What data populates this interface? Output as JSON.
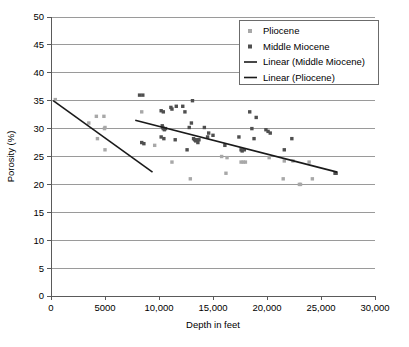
{
  "chart_data": {
    "type": "scatter",
    "title": "",
    "xlabel": "Depth in feet",
    "ylabel": "Porosity (%)",
    "xlim": [
      0,
      30000
    ],
    "ylim": [
      0,
      50
    ],
    "grid": "horizontal",
    "legend_position": "top-right",
    "x_ticks": [
      {
        "value": 0,
        "label": "0"
      },
      {
        "value": 5000,
        "label": "5000"
      },
      {
        "value": 10000,
        "label": "10,000"
      },
      {
        "value": 15000,
        "label": "15,000"
      },
      {
        "value": 20000,
        "label": "20,000"
      },
      {
        "value": 25000,
        "label": "25,000"
      },
      {
        "value": 30000,
        "label": "30,000"
      }
    ],
    "y_ticks": [
      {
        "value": 0,
        "label": "0"
      },
      {
        "value": 5,
        "label": "5"
      },
      {
        "value": 10,
        "label": "10"
      },
      {
        "value": 15,
        "label": "15"
      },
      {
        "value": 20,
        "label": "20"
      },
      {
        "value": 25,
        "label": "25"
      },
      {
        "value": 30,
        "label": "30"
      },
      {
        "value": 35,
        "label": "35"
      },
      {
        "value": 40,
        "label": "40"
      },
      {
        "value": 45,
        "label": "45"
      },
      {
        "value": 50,
        "label": "50"
      }
    ],
    "legend": [
      {
        "name": "Pliocene",
        "type": "marker",
        "color": "#a8a8a8"
      },
      {
        "name": "Middle Miocene",
        "type": "marker",
        "color": "#4f4f4f"
      },
      {
        "name": "Linear (Middle Miocene)",
        "type": "line",
        "color": "#1a1a1a"
      },
      {
        "name": "Linear (Pliocene)",
        "type": "line",
        "color": "#1a1a1a"
      }
    ],
    "series": [
      {
        "name": "Pliocene",
        "color": "#a8a8a8",
        "marker": "square",
        "points": [
          [
            400,
            35.2
          ],
          [
            3500,
            31.0
          ],
          [
            4200,
            32.2
          ],
          [
            4300,
            28.2
          ],
          [
            4900,
            32.2
          ],
          [
            4950,
            30.0
          ],
          [
            5000,
            30.2
          ],
          [
            5000,
            26.2
          ],
          [
            8400,
            33.0
          ],
          [
            9600,
            27.0
          ],
          [
            11200,
            24.0
          ],
          [
            12900,
            21.0
          ],
          [
            15800,
            25.0
          ],
          [
            16300,
            24.8
          ],
          [
            16200,
            22.0
          ],
          [
            17600,
            24.0
          ],
          [
            17800,
            24.0
          ],
          [
            18000,
            24.0
          ],
          [
            20200,
            24.8
          ],
          [
            21500,
            21.0
          ],
          [
            21600,
            24.2
          ],
          [
            22400,
            24.2
          ],
          [
            23000,
            20.0
          ],
          [
            23100,
            20.0
          ],
          [
            23900,
            24.0
          ],
          [
            24200,
            21.0
          ]
        ]
      },
      {
        "name": "Middle Miocene",
        "color": "#4f4f4f",
        "marker": "square",
        "points": [
          [
            8200,
            36.0
          ],
          [
            8500,
            36.0
          ],
          [
            8400,
            27.5
          ],
          [
            8600,
            27.3
          ],
          [
            10200,
            33.2
          ],
          [
            10400,
            33.0
          ],
          [
            10300,
            30.5
          ],
          [
            10350,
            30.2
          ],
          [
            10400,
            30.0
          ],
          [
            10500,
            29.8
          ],
          [
            10600,
            30.0
          ],
          [
            10200,
            28.5
          ],
          [
            10450,
            28.2
          ],
          [
            11100,
            33.8
          ],
          [
            11200,
            33.5
          ],
          [
            11600,
            34.0
          ],
          [
            11500,
            28.0
          ],
          [
            12200,
            34.0
          ],
          [
            12400,
            33.0
          ],
          [
            12600,
            26.2
          ],
          [
            12800,
            30.2
          ],
          [
            13100,
            35.0
          ],
          [
            13000,
            31.0
          ],
          [
            13200,
            28.2
          ],
          [
            13300,
            28.0
          ],
          [
            13400,
            27.8
          ],
          [
            13500,
            28.0
          ],
          [
            13600,
            27.5
          ],
          [
            13700,
            28.0
          ],
          [
            14200,
            30.2
          ],
          [
            14500,
            28.5
          ],
          [
            14600,
            29.2
          ],
          [
            15000,
            28.8
          ],
          [
            16100,
            27.0
          ],
          [
            17400,
            28.5
          ],
          [
            17600,
            26.2
          ],
          [
            17700,
            26.0
          ],
          [
            17900,
            26.2
          ],
          [
            18400,
            33.0
          ],
          [
            18600,
            30.0
          ],
          [
            18800,
            28.2
          ],
          [
            19000,
            32.0
          ],
          [
            19900,
            29.8
          ],
          [
            20100,
            29.5
          ],
          [
            20300,
            29.2
          ],
          [
            21600,
            26.2
          ],
          [
            22300,
            28.2
          ],
          [
            26300,
            22.0
          ],
          [
            26400,
            22.0
          ]
        ]
      }
    ],
    "trendlines": [
      {
        "name": "Linear (Middle Miocene)",
        "color": "#1a1a1a",
        "x_start": 7800,
        "y_start": 31.5,
        "x_end": 26500,
        "y_end": 22.2
      },
      {
        "name": "Linear (Pliocene)",
        "color": "#1a1a1a",
        "x_start": 200,
        "y_start": 35.0,
        "x_end": 9400,
        "y_end": 22.2
      }
    ]
  }
}
